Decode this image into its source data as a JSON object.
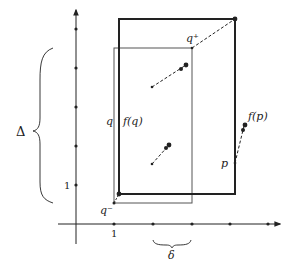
{
  "diagram": {
    "labels": {
      "q_plus": "q⁺",
      "q_minus": "q⁻",
      "q": "q",
      "f_q": "f(q)",
      "p": "p",
      "f_p": "f(p)",
      "delta_upper": "Δ",
      "delta_lower": "δ",
      "x_tick_1": "1",
      "y_tick_1": "1"
    },
    "colors": {
      "stroke": "#222222",
      "thin_rect": "#555555"
    }
  }
}
